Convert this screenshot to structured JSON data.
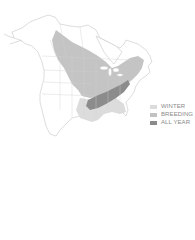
{
  "map": {
    "subject": "range map of North America",
    "colors": {
      "background": "#ffffff",
      "land": "#ffffff",
      "border": "#c8c8c8",
      "winter": "#e0e0e0",
      "breeding": "#c4c4c4",
      "all_year": "#8c8c8c"
    }
  },
  "legend": {
    "items": [
      {
        "label": "WINTER",
        "color": "#dcdcdc"
      },
      {
        "label": "BREEDING",
        "color": "#c2c2c2"
      },
      {
        "label": "ALL YEAR",
        "color": "#8a8a8a"
      }
    ]
  }
}
